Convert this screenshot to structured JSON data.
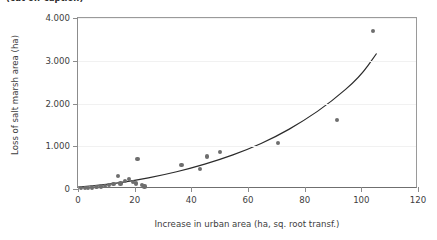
{
  "caption": {
    "text": "(cut off caption)"
  },
  "chart_data": {
    "type": "scatter",
    "title": "",
    "xlabel": "Increase in urban area (ha, sq. root transf.)",
    "ylabel": "Loss of salt marsh area (ha)",
    "xlim": [
      0,
      120
    ],
    "ylim": [
      0,
      4000
    ],
    "grid": true,
    "legend": null,
    "xticks": [
      0,
      20,
      40,
      60,
      80,
      100,
      120
    ],
    "xticklabels": [
      "0",
      "20",
      "40",
      "60",
      "80",
      "100",
      "120"
    ],
    "yticks": [
      0,
      1000,
      2000,
      3000,
      4000
    ],
    "yticklabels": [
      "0",
      "1.000",
      "2.000",
      "3.000",
      "4.000"
    ],
    "marker_color": "#6e6e6e",
    "line_color": "#2b2b2b",
    "series": [
      {
        "name": "observations",
        "points": [
          [
            1.0,
            20
          ],
          [
            2.5,
            25
          ],
          [
            3.5,
            30
          ],
          [
            5.0,
            35
          ],
          [
            6.5,
            45
          ],
          [
            8.0,
            60
          ],
          [
            9.5,
            70
          ],
          [
            11.0,
            100
          ],
          [
            12.5,
            120
          ],
          [
            14.0,
            300
          ],
          [
            15.0,
            130
          ],
          [
            16.5,
            180
          ],
          [
            18.0,
            240
          ],
          [
            19.5,
            160
          ],
          [
            20.5,
            130
          ],
          [
            21.0,
            700
          ],
          [
            22.5,
            90
          ],
          [
            23.5,
            60
          ],
          [
            36.5,
            560
          ],
          [
            43.0,
            460
          ],
          [
            45.5,
            760
          ],
          [
            50.0,
            860
          ],
          [
            70.5,
            1080
          ],
          [
            91.5,
            1620
          ],
          [
            104.0,
            3700
          ]
        ]
      }
    ],
    "fit": {
      "name": "fitted curve",
      "kind": "quadratic",
      "points": [
        [
          0,
          0
        ],
        [
          10,
          60
        ],
        [
          20,
          150
        ],
        [
          30,
          280
        ],
        [
          40,
          440
        ],
        [
          50,
          640
        ],
        [
          60,
          880
        ],
        [
          70,
          1180
        ],
        [
          80,
          1560
        ],
        [
          90,
          2020
        ],
        [
          100,
          2600
        ],
        [
          106,
          3160
        ]
      ]
    }
  }
}
